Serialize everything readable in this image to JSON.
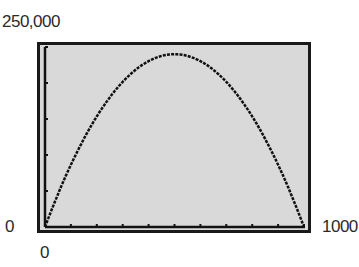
{
  "chart_data": {
    "type": "line",
    "title": "",
    "xlabel": "",
    "ylabel": "",
    "xlim": [
      0,
      1000
    ],
    "ylim": [
      0,
      250000
    ],
    "x_tick_labels": [
      "0",
      "1000"
    ],
    "y_tick_labels": [
      "0",
      "250,000"
    ],
    "x_tick_count": 11,
    "y_tick_count": 6,
    "grid": false,
    "legend": null,
    "series": [
      {
        "name": "parabola",
        "x": [
          0,
          100,
          200,
          300,
          400,
          500,
          600,
          700,
          800,
          900,
          1000
        ],
        "values": [
          0,
          86400,
          153600,
          201600,
          230400,
          240000,
          230400,
          201600,
          153600,
          86400,
          0
        ]
      }
    ],
    "style": "graphing-calculator screen, dotted pixel curve"
  },
  "labels": {
    "y_max": "250,000",
    "y_min": "0",
    "x_min": "0",
    "x_max": "1000"
  }
}
